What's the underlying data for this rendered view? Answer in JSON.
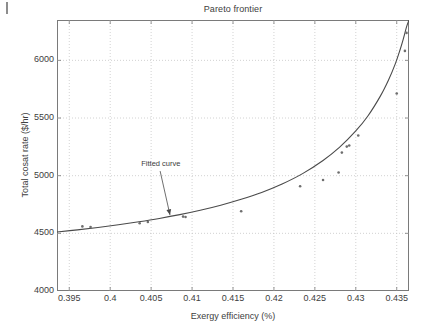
{
  "figure": {
    "title": "Pareto frontier",
    "background": "#ffffff",
    "axis_color": "#7a7a7a",
    "grid_color": "#bfbfbf",
    "curve_color": "#4a4a4a",
    "marker_color": "#6e6e6e",
    "text_color": "#404040"
  },
  "annotation": {
    "label": "Fitted curve"
  },
  "chart_data": {
    "type": "scatter",
    "title": "Pareto frontier",
    "subtitle": "",
    "xlabel": "Exergy efficiency (%)",
    "ylabel": "Total cosat rate ($/hr)",
    "xlim": [
      0.3935,
      0.4365
    ],
    "ylim": [
      4000,
      6350
    ],
    "xticks": [
      0.395,
      0.4,
      0.405,
      0.41,
      0.415,
      0.42,
      0.425,
      0.43,
      0.435
    ],
    "xtick_labels": [
      "0.395",
      "0.4",
      "0.405",
      "0.41",
      "0.415",
      "0.42",
      "0.425",
      "0.43",
      "0.435"
    ],
    "yticks": [
      4000,
      4500,
      5000,
      5500,
      6000
    ],
    "ytick_labels": [
      "4000",
      "4500",
      "5000",
      "5500",
      "6000"
    ],
    "grid": true,
    "grid_style": "dotted",
    "legend": false,
    "annotations": [
      {
        "text": "Fitted curve",
        "text_x": 0.4055,
        "text_y": 5095,
        "arrow_from_x": 0.4061,
        "arrow_from_y": 5040,
        "arrow_to_x": 0.4073,
        "arrow_to_y": 4660
      }
    ],
    "series": [
      {
        "name": "Pareto points",
        "type": "scatter",
        "marker": "dot",
        "x": [
          0.3966,
          0.3976,
          0.4036,
          0.4046,
          0.4089,
          0.4092,
          0.416,
          0.4232,
          0.426,
          0.4279,
          0.4283,
          0.4289,
          0.4292,
          0.4303,
          0.435,
          0.436,
          0.4362
        ],
        "y": [
          4560,
          4555,
          4588,
          4598,
          4645,
          4642,
          4692,
          4908,
          4962,
          5028,
          5200,
          5252,
          5262,
          5348,
          5712,
          6082,
          6238
        ]
      },
      {
        "name": "Fitted curve",
        "type": "line",
        "x": [
          0.3935,
          0.396,
          0.3985,
          0.401,
          0.4035,
          0.406,
          0.4085,
          0.411,
          0.4135,
          0.416,
          0.4185,
          0.421,
          0.4235,
          0.426,
          0.428,
          0.43,
          0.4315,
          0.433,
          0.434,
          0.4348,
          0.4354,
          0.4358,
          0.4362,
          0.4365
        ],
        "y": [
          4512,
          4530,
          4551,
          4574,
          4600,
          4629,
          4662,
          4700,
          4744,
          4795,
          4855,
          4928,
          5018,
          5132,
          5245,
          5388,
          5520,
          5690,
          5830,
          5965,
          6090,
          6185,
          6290,
          6350
        ]
      }
    ]
  }
}
